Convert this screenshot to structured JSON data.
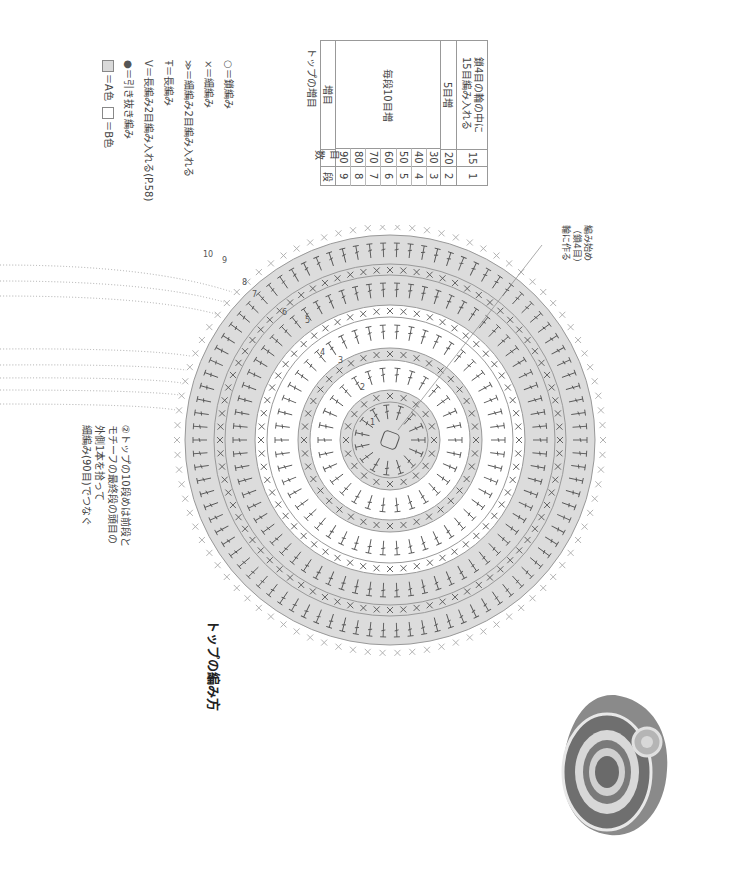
{
  "title": "トップの編み方",
  "legend": {
    "items": [
      {
        "symbol": "○",
        "icon": "chain-stitch-icon",
        "label": "＝鎖編み"
      },
      {
        "symbol": "×",
        "icon": "single-crochet-icon",
        "label": "＝細編み"
      },
      {
        "symbol": "≫",
        "icon": "single-crochet-increase-icon",
        "label": "＝細編み2目編み入れる"
      },
      {
        "symbol": "Ŧ",
        "icon": "double-crochet-icon",
        "label": "＝長編み"
      },
      {
        "symbol": "V",
        "icon": "double-crochet-increase-icon",
        "label": "＝長編み2目編み入れる(P.58)"
      },
      {
        "symbol": "●",
        "icon": "slip-stitch-icon",
        "label": "＝引き抜き編み"
      }
    ],
    "colors": {
      "a_label": "＝A色",
      "b_label": "＝B色",
      "a_color": "#d9d9d9",
      "b_color": "#ffffff"
    }
  },
  "increase_table": {
    "title": "トップの増目",
    "headers": {
      "row": "段",
      "count": "目数",
      "increase": "増目"
    },
    "rows": [
      {
        "row": "9",
        "count": "90"
      },
      {
        "row": "8",
        "count": "80"
      },
      {
        "row": "7",
        "count": "70"
      },
      {
        "row": "6",
        "count": "60"
      },
      {
        "row": "5",
        "count": "50"
      },
      {
        "row": "4",
        "count": "40"
      },
      {
        "row": "3",
        "count": "30"
      },
      {
        "row": "2",
        "count": "20"
      },
      {
        "row": "1",
        "count": "15"
      }
    ],
    "increase_notes": {
      "rows_3_9": "毎段10目増",
      "row_2": "5目増",
      "row_1": "鎖4目の輪の中に\n15目編み入れる"
    }
  },
  "diagram": {
    "round_labels": [
      "1",
      "2",
      "3",
      "4",
      "5",
      "6",
      "7",
      "8",
      "9",
      "10"
    ],
    "ring_colors": [
      "#d9d9d9",
      "#ffffff",
      "#d9d9d9",
      "#ffffff",
      "#d9d9d9",
      "#d9d9d9"
    ],
    "stroke_color": "#555555"
  },
  "notes": {
    "start": "編み始め\n（鎖4目）\n輪に作る",
    "join": "②トップの10段めは前段と\nモチーフの最終段の頭目の\n外側1本を拾って\n細編み(90目)でつなぐ"
  }
}
